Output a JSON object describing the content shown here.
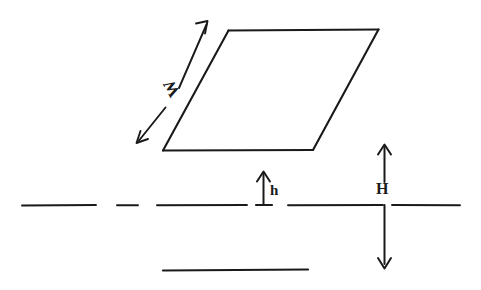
{
  "figure": {
    "kind": "hand-drawn-dimension-diagram",
    "background_color": "#ffffff",
    "ink_color": "#1a1a1a",
    "width": 481,
    "height": 290
  },
  "labels": {
    "slab_width": "W",
    "small_height": "h",
    "large_height": "H"
  },
  "shapes": {
    "parallelogram": {
      "name": "slab-parallelogram",
      "points": "228,30 378,30 313,150 163,150"
    },
    "dimension_arrow_w": {
      "name": "w-dimension-arrow",
      "style": "double-headed",
      "from": [
        137,
        143
      ],
      "to": [
        208,
        22
      ]
    },
    "dimension_arrow_h_small": {
      "name": "h-dimension-arrow",
      "style": "single-headed-up",
      "from": [
        263,
        205
      ],
      "to": [
        263,
        172
      ]
    },
    "dimension_arrow_h_big": {
      "name": "big-h-dimension-arrow",
      "style": "double-headed-vertical",
      "from": [
        384,
        145
      ],
      "to": [
        384,
        268
      ]
    },
    "baseline": {
      "name": "reference-baseline",
      "y": 205,
      "segments": [
        [
          22,
          96
        ],
        [
          117,
          138
        ],
        [
          157,
          247
        ],
        [
          256,
          272
        ],
        [
          288,
          384
        ],
        [
          392,
          460
        ]
      ]
    },
    "lower_line": {
      "name": "lower-reference-line",
      "y": 270,
      "from_x": 163,
      "to_x": 308
    },
    "h_axis_stub": {
      "name": "big-h-axis-stub",
      "x": 384,
      "from_y": 205,
      "to_y": 262
    }
  }
}
